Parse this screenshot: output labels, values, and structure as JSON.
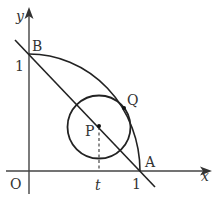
{
  "diagram": {
    "axes": {
      "x_label": "x",
      "y_label": "y",
      "origin_label": "O",
      "x_tick_label": "1",
      "y_tick_label": "1",
      "t_label": "t"
    },
    "points": {
      "A": "A",
      "B": "B",
      "P": "P",
      "Q": "Q"
    },
    "elements": [
      "quarter arc from B(0,1) to A(1,0)",
      "line AB",
      "circle centered at P on line AB, tangent to arc at Q",
      "dashed vertical from P to x-axis at t"
    ],
    "colors": {
      "stroke": "#222222",
      "axis": "#444444",
      "text": "#333333"
    }
  }
}
